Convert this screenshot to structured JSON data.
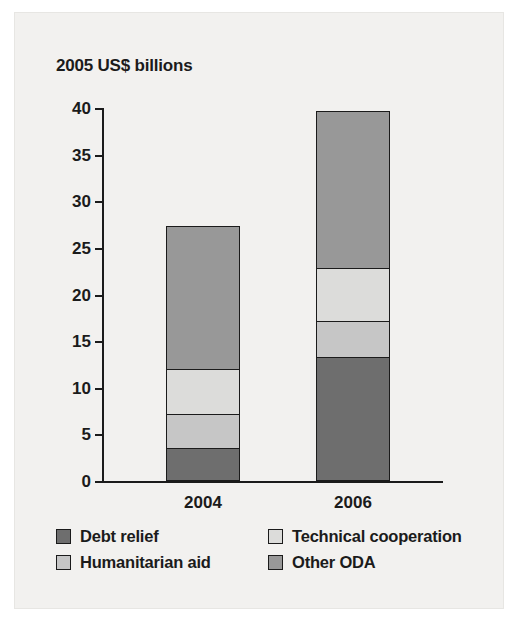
{
  "chart_data": {
    "type": "bar",
    "subtype": "stacked-bar",
    "title": "2005 US$ billions",
    "xlabel": "",
    "ylabel": "",
    "categories": [
      "2004",
      "2006"
    ],
    "ylim": [
      0,
      40
    ],
    "yticks": [
      0,
      5,
      10,
      15,
      20,
      25,
      30,
      35,
      40
    ],
    "ytick_labels": [
      "0",
      "5",
      "10",
      "15",
      "20",
      "25",
      "30",
      "35",
      "40"
    ],
    "grid": false,
    "legend_position": "bottom",
    "series": [
      {
        "name": "Debt relief",
        "color": "#6e6e6e",
        "values": [
          3.4,
          13.2
        ]
      },
      {
        "name": "Humanitarian aid",
        "color": "#c6c6c6",
        "values": [
          3.7,
          3.8
        ]
      },
      {
        "name": "Technical cooperation",
        "color": "#dcdcda",
        "values": [
          4.8,
          5.7
        ]
      },
      {
        "name": "Other ODA",
        "color": "#989898",
        "values": [
          15.3,
          16.8
        ]
      }
    ],
    "totals": [
      27.2,
      39.5
    ],
    "cumulative": {
      "2004": [
        3.4,
        7.1,
        11.9,
        27.2
      ],
      "2006": [
        13.2,
        17.0,
        22.7,
        39.5
      ]
    },
    "legend_order": [
      "Debt relief",
      "Technical cooperation",
      "Humanitarian aid",
      "Other ODA"
    ]
  },
  "legend": {
    "rows": [
      [
        {
          "label": "Debt relief",
          "color": "#6e6e6e"
        },
        {
          "label": "Technical cooperation",
          "color": "#dcdcda"
        }
      ],
      [
        {
          "label": "Humanitarian aid",
          "color": "#c6c6c6"
        },
        {
          "label": "Other ODA",
          "color": "#989898"
        }
      ]
    ]
  }
}
